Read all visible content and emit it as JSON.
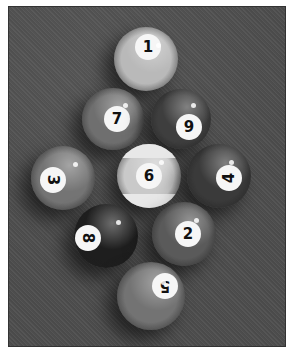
{
  "image": {
    "description": "Black-and-white photograph of nine billiard balls racked in a diamond formation on felt",
    "background_color": "#4f4f4f",
    "border_color": "#ffffff"
  },
  "balls": [
    {
      "number": "1",
      "cx": 137,
      "cy": 52,
      "r": 32,
      "color": "#b9b9b9",
      "spot_dx": 2,
      "spot_dy": -12,
      "rot": 0,
      "striped": false
    },
    {
      "number": "7",
      "cx": 104,
      "cy": 112,
      "r": 31,
      "color": "#6f6f6f",
      "spot_dx": 4,
      "spot_dy": 0,
      "rot": 0,
      "striped": false
    },
    {
      "number": "9",
      "cx": 172,
      "cy": 112,
      "r": 30,
      "color": "#3e3e3e",
      "spot_dx": 8,
      "spot_dy": 8,
      "rot": 0,
      "striped": false
    },
    {
      "number": "3",
      "cx": 54,
      "cy": 171,
      "r": 32,
      "color": "#747474",
      "spot_dx": -10,
      "spot_dy": 2,
      "rot": 90,
      "striped": false
    },
    {
      "number": "6",
      "cx": 140,
      "cy": 169,
      "r": 32,
      "color": "#c9c9c9",
      "spot_dx": 0,
      "spot_dy": 0,
      "rot": 0,
      "striped": true
    },
    {
      "number": "4",
      "cx": 210,
      "cy": 169,
      "r": 32,
      "color": "#3a3a3a",
      "spot_dx": 10,
      "spot_dy": 2,
      "rot": 270,
      "striped": false
    },
    {
      "number": "8",
      "cx": 97,
      "cy": 229,
      "r": 32,
      "color": "#1e1e1e",
      "spot_dx": -18,
      "spot_dy": 2,
      "rot": 90,
      "striped": false
    },
    {
      "number": "2",
      "cx": 175,
      "cy": 227,
      "r": 32,
      "color": "#5a5a5a",
      "spot_dx": 4,
      "spot_dy": 0,
      "rot": 0,
      "striped": false
    },
    {
      "number": "5",
      "cx": 142,
      "cy": 289,
      "r": 34,
      "color": "#737373",
      "spot_dx": 14,
      "spot_dy": -10,
      "rot": 180,
      "striped": false
    }
  ]
}
